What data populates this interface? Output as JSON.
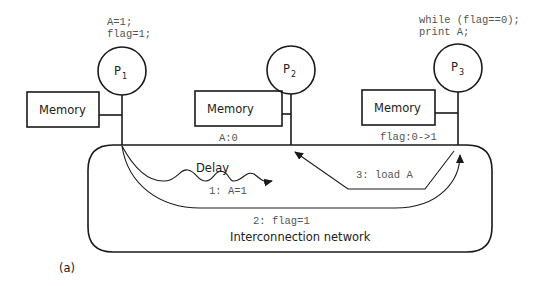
{
  "processors": [
    {
      "id": "P1",
      "label": "P",
      "sub": "1",
      "code": [
        "A=1;",
        "flag=1;"
      ]
    },
    {
      "id": "P2",
      "label": "P",
      "sub": "2",
      "code": []
    },
    {
      "id": "P3",
      "label": "P",
      "sub": "3",
      "code": [
        "while (flag==0);",
        "print A;"
      ]
    }
  ],
  "memories": [
    {
      "label": "Memory",
      "value": ""
    },
    {
      "label": "Memory",
      "value": "A:0"
    },
    {
      "label": "Memory",
      "value": "flag:0->1"
    }
  ],
  "network": {
    "label": "Interconnection network",
    "messages": {
      "m1": "1: A=1",
      "m2": "2: flag=1",
      "m3": "3: load A",
      "delay": "Delay"
    }
  },
  "caption": "(a)"
}
